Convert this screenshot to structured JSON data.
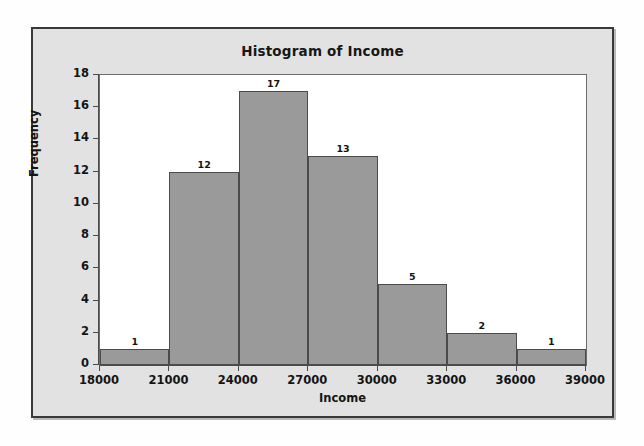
{
  "chart_data": {
    "type": "bar",
    "title": "Histogram of Income",
    "xlabel": "Income",
    "ylabel": "Frequency",
    "categories": [
      "18000-21000",
      "21000-24000",
      "24000-27000",
      "27000-30000",
      "30000-33000",
      "33000-36000",
      "36000-39000"
    ],
    "bin_edges": [
      18000,
      21000,
      24000,
      27000,
      30000,
      33000,
      36000,
      39000
    ],
    "values": [
      1,
      12,
      17,
      13,
      5,
      2,
      1
    ],
    "data_labels": [
      "1",
      "12",
      "17",
      "13",
      "5",
      "2",
      "1"
    ],
    "xlim": [
      18000,
      39000
    ],
    "ylim": [
      0,
      18
    ],
    "x_ticks": [
      18000,
      21000,
      24000,
      27000,
      30000,
      33000,
      36000,
      39000
    ],
    "x_tick_labels": [
      "18000",
      "21000",
      "24000",
      "27000",
      "30000",
      "33000",
      "36000",
      "39000"
    ],
    "y_ticks": [
      0,
      2,
      4,
      6,
      8,
      10,
      12,
      14,
      16,
      18
    ],
    "y_tick_labels": [
      "0",
      "2",
      "4",
      "6",
      "8",
      "10",
      "12",
      "14",
      "16",
      "18"
    ],
    "grid": false,
    "legend": "none",
    "bar_fill_color": "#9a9a9a",
    "bar_edge_color": "#4b4b4b",
    "plot_background": "#ffffff",
    "panel_background": "#e2e2e2",
    "panel_border_color": "#3a3a3a"
  }
}
